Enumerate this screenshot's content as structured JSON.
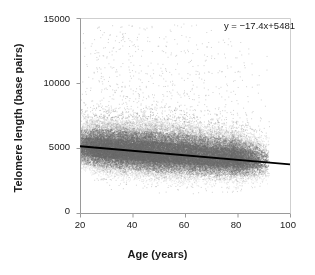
{
  "chart_data": {
    "type": "scatter",
    "title": "",
    "xlabel": "Age (years)",
    "ylabel": "Telomere length (base pairs)",
    "xlim": [
      20,
      100
    ],
    "ylim": [
      0,
      15000
    ],
    "xticks": [
      20,
      40,
      60,
      80,
      100
    ],
    "yticks": [
      0,
      5000,
      10000,
      15000
    ],
    "xtick_labels": [
      "20",
      "40",
      "60",
      "80",
      "100"
    ],
    "ytick_labels": [
      "0",
      "5000",
      "10000",
      "15000"
    ],
    "grid": false,
    "legend": "none",
    "annotation": "y = −17.4x+5481",
    "point_color": "#8a8a8a",
    "point_count_approx": 60000,
    "series": [
      {
        "name": "Telomere length vs age",
        "marker": "dot",
        "color": "#8a8a8a",
        "description": "Dense cloud of individual measurements from age 20 to ~92, centred near 5000 base pairs and declining with age; sparse high outliers up to ~14500."
      }
    ],
    "fit_line": {
      "name": "Linear regression",
      "color": "#000000",
      "equation": "y = -17.4x + 5481",
      "slope": -17.4,
      "intercept": 5481,
      "x_start": 20,
      "x_end": 100,
      "y_start": 5133,
      "y_end": 3741
    },
    "cloud_profile": {
      "x_min": 20,
      "x_max": 92,
      "center_at_x": [
        {
          "x": 20,
          "y": 5150,
          "spread": 900
        },
        {
          "x": 30,
          "y": 5000,
          "spread": 980
        },
        {
          "x": 40,
          "y": 4850,
          "spread": 1020
        },
        {
          "x": 50,
          "y": 4700,
          "spread": 1050
        },
        {
          "x": 60,
          "y": 4560,
          "spread": 1030
        },
        {
          "x": 70,
          "y": 4400,
          "spread": 990
        },
        {
          "x": 80,
          "y": 4250,
          "spread": 930
        },
        {
          "x": 90,
          "y": 4100,
          "spread": 820
        }
      ],
      "outlier_fraction": 0.02,
      "outlier_y_max": 14600
    }
  },
  "axes": {
    "y_axis_title": "Telomere length (base pairs)",
    "x_axis_title": "Age (years)"
  },
  "annotation": {
    "equation": "y = −17.4x+5481"
  },
  "colors": {
    "points": "#8a8a8a",
    "fit_line": "#000000",
    "axis": "#9a9a9a",
    "text": "#1a1a1a",
    "background": "#ffffff"
  }
}
